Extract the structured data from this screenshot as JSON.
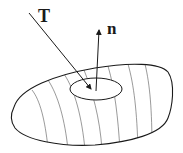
{
  "diagram": {
    "labels": {
      "tangent_vector": "T",
      "normal_vector": "n"
    },
    "elements": [
      "surface",
      "surface-patch-ellipse",
      "tangent-vector-arrow",
      "normal-vector-arrow",
      "surface-contour-lines"
    ],
    "colors": {
      "stroke": "#1a1a1a",
      "contour": "#555555",
      "background": "#ffffff"
    }
  }
}
